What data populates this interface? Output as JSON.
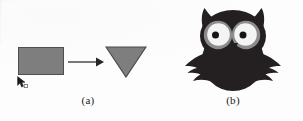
{
  "figure": {
    "background_color": "#fdfdfd",
    "width": 303,
    "height": 121
  },
  "panel_a": {
    "label": "(a)",
    "shapes": {
      "source": {
        "icon": "rectangle-shape",
        "fill_color": "#7e7e7e",
        "stroke_color": "#4e4e4e"
      },
      "arrow": {
        "icon": "right-arrow-icon",
        "color": "#303030"
      },
      "target": {
        "icon": "down-triangle-shape",
        "fill_color": "#7e7e7e",
        "stroke_color": "#4e4e4e"
      },
      "cursor": {
        "icon": "mouse-pointer-icon",
        "color": "#1a1a1a"
      }
    }
  },
  "panel_b": {
    "label": "(b)",
    "illustration": {
      "icon": "owl-illustration",
      "body_color": "#241f20",
      "eye_ring_color": "#8c8c8c",
      "eye_white_color": "#f4f4f4",
      "pupil_color": "#151515"
    }
  }
}
